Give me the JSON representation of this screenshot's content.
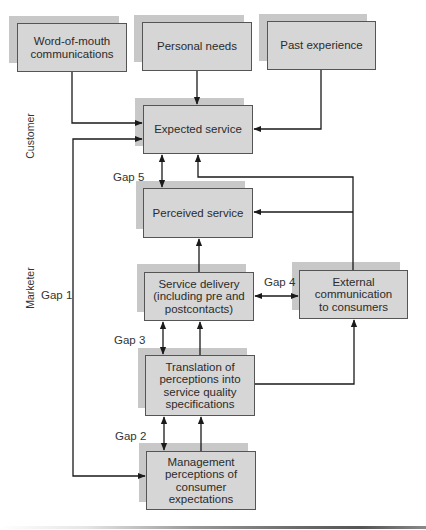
{
  "diagram": {
    "side_labels": {
      "customer": "Customer",
      "marketer": "Marketer"
    },
    "boxes": {
      "word_of_mouth": "Word-of-mouth communications",
      "personal_needs": "Personal needs",
      "past_experience": "Past experience",
      "expected_service": "Expected service",
      "perceived_service": "Perceived service",
      "service_delivery": "Service delivery (including pre and postcontacts)",
      "external_communication": "External communication to consumers",
      "translation": "Translation of perceptions into service quality specifications",
      "management_perceptions": "Management perceptions of consumer expectations"
    },
    "gaps": {
      "gap1": "Gap 1",
      "gap2": "Gap 2",
      "gap3": "Gap 3",
      "gap4": "Gap 4",
      "gap5": "Gap 5"
    },
    "colors": {
      "box_fill": "#d6d6d6",
      "shadow_fill": "#c8c8c8",
      "line": "#1a1a1a"
    }
  }
}
